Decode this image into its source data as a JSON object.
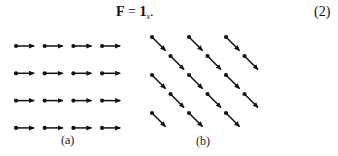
{
  "equation": {
    "lhs": "F",
    "equals": "=",
    "rhs_main": "1",
    "rhs_sub": "x",
    "trailing": ".",
    "number": "(2)"
  },
  "figures": {
    "a": {
      "caption": "(a)",
      "description": "uniform field, all arrows pointing in +x direction",
      "rows": 4,
      "cols": 4,
      "direction_deg": 0
    },
    "b": {
      "caption": "(b)",
      "description": "uniform field viewed rotated, arrows pointing down-right in staggered lattice",
      "rows": 5,
      "cols": 3,
      "direction_deg": -45
    }
  },
  "colors": {
    "ink": "#111111",
    "background": "#ffffff"
  }
}
